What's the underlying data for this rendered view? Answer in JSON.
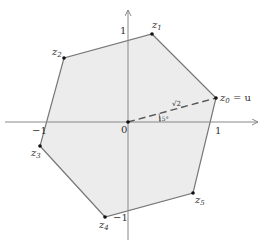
{
  "diagram": {
    "type": "hexagon-in-complex-plane",
    "origin_label": "0",
    "axis_ticks": {
      "x_pos": "1",
      "x_neg": "−1",
      "y_pos": "1",
      "y_neg": "−1"
    },
    "vertices": [
      {
        "id": "z0",
        "label": "z",
        "sub": "0",
        "suffix": " = u",
        "x": 216,
        "y": 98
      },
      {
        "id": "z1",
        "label": "z",
        "sub": "1",
        "suffix": "",
        "x": 152,
        "y": 34
      },
      {
        "id": "z2",
        "label": "z",
        "sub": "2",
        "suffix": "",
        "x": 64,
        "y": 58
      },
      {
        "id": "z3",
        "label": "z",
        "sub": "3",
        "suffix": "",
        "x": 40,
        "y": 146
      },
      {
        "id": "z4",
        "label": "z",
        "sub": "4",
        "suffix": "",
        "x": 105,
        "y": 217
      },
      {
        "id": "z5",
        "label": "z",
        "sub": "5",
        "suffix": "",
        "x": 193,
        "y": 193
      }
    ],
    "radius_label": "√2",
    "angle_label": "15°",
    "colors": {
      "fill": "#ececec",
      "edge": "#777777",
      "axis": "#888888",
      "text": "#333333"
    }
  }
}
